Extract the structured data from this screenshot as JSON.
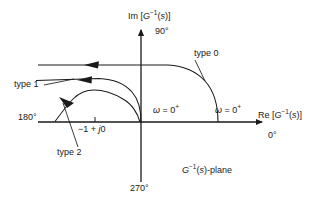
{
  "figure": {
    "name": "inverse-polar-plot",
    "plane_label": "G−1(s)-plane",
    "background": "#ffffff",
    "stroke": "#1a1a1a"
  },
  "axes": {
    "imaginary": {
      "label": "Im [G−1(s)]",
      "angle_tip": "90°",
      "angle_tail": "270°"
    },
    "real": {
      "label": "Re [G−1(s)]",
      "angle_tip": "0°",
      "angle_tail": "180°"
    }
  },
  "annotations": {
    "critical_point": "−1 + j0",
    "omega_left": "ω = 0⁺",
    "omega_right": "ω = 0⁺"
  },
  "curves": [
    {
      "id": "type0",
      "label": "type 0"
    },
    {
      "id": "type1",
      "label": "type 1"
    },
    {
      "id": "type2",
      "label": "type 2"
    }
  ],
  "chart_data": {
    "type": "line",
    "xlabel": "Re [G−1(s)]",
    "ylabel": "Im [G−1(s)]",
    "grid": false,
    "legend": "inline-callouts",
    "axis_angle_ticks": {
      "right": "0°",
      "up": "90°",
      "left": "180°",
      "down": "270°"
    },
    "markers": [
      {
        "label": "−1 + j0",
        "x": -1,
        "y": 0
      },
      {
        "label": "ω = 0⁺",
        "x": 0,
        "y": 0
      },
      {
        "label": "ω = 0⁺",
        "x": 1.95,
        "y": 0
      }
    ],
    "series": [
      {
        "name": "type 0",
        "start": {
          "x": 1.95,
          "y": 0
        },
        "end": {
          "x": -3.4,
          "y": 1.05
        },
        "direction": "leftward",
        "description": "starts on positive real axis at ω = 0⁺, rises and flattens into a horizontal asymptote in the upper-left quadrant"
      },
      {
        "name": "type 1",
        "start": {
          "x": 0,
          "y": 0
        },
        "end": {
          "x": -3.6,
          "y": 0.62
        },
        "direction": "leftward",
        "description": "starts at the origin at ω = 0⁺, rises over a broad hump and flattens toward the upper-left"
      },
      {
        "name": "type 2",
        "start": {
          "x": 0,
          "y": 0
        },
        "end": {
          "x": -3.1,
          "y": -0.05
        },
        "direction": "up-and-leftward",
        "description": "starts at the origin at ω = 0⁺, rises into a rounded hump then falls back and crosses the negative real axis"
      }
    ]
  }
}
